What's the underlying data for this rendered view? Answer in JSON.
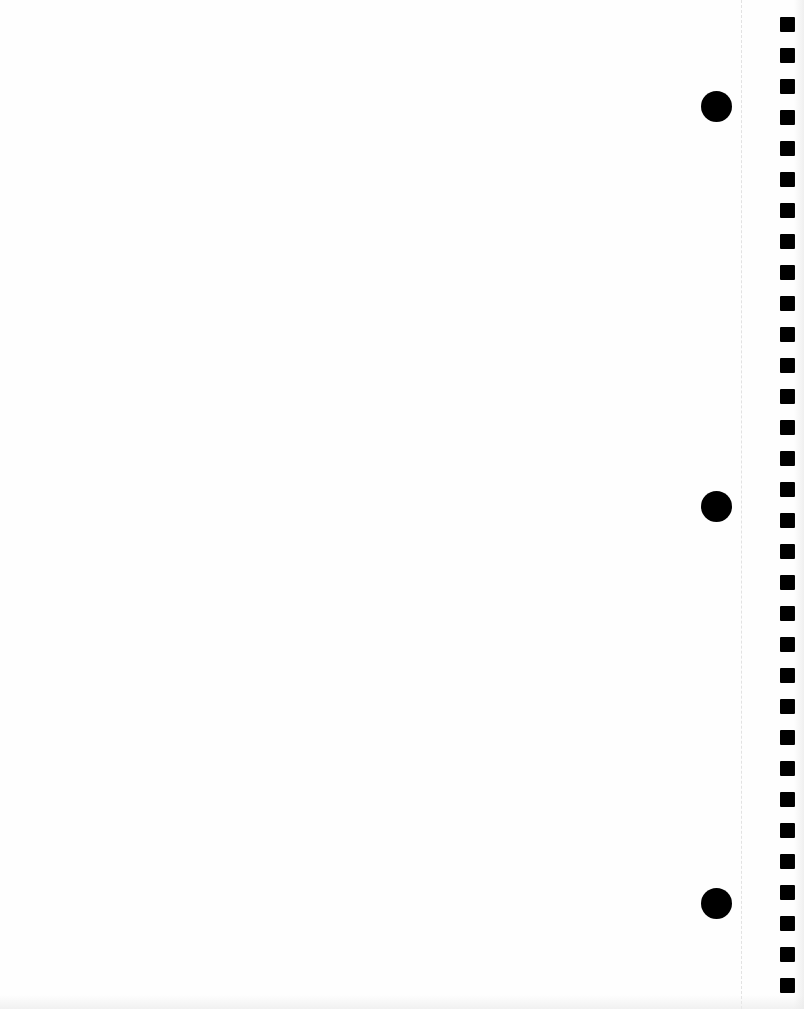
{
  "page": {
    "type": "blank notebook page",
    "background_color": "#fefefe",
    "hole_color": "#000000",
    "ring_holes": [
      {
        "cx": 716,
        "cy": 106
      },
      {
        "cx": 716,
        "cy": 506
      },
      {
        "cx": 716,
        "cy": 903
      }
    ],
    "spiral_holes_count": 32,
    "spiral_holes_start_y": 24,
    "spiral_holes_spacing": 31
  }
}
